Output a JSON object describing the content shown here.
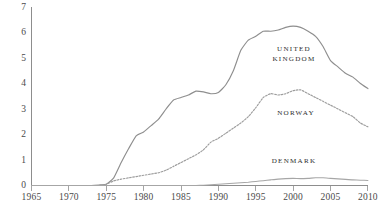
{
  "chart_data": {
    "type": "line",
    "title": "",
    "subtitle": "",
    "xlabel": "",
    "ylabel": "",
    "xlim": [
      1965,
      2010
    ],
    "ylim": [
      0,
      7
    ],
    "grid": false,
    "legend_position": "inline-annotations",
    "x_ticks": [
      "1965",
      "1970",
      "1975",
      "1980",
      "1985",
      "1990",
      "1995",
      "2000",
      "2005",
      "2010"
    ],
    "y_ticks": [
      "0",
      "1",
      "2",
      "3",
      "4",
      "5",
      "6",
      "7"
    ],
    "x": [
      1965,
      1966,
      1967,
      1968,
      1969,
      1970,
      1971,
      1972,
      1973,
      1974,
      1975,
      1976,
      1977,
      1978,
      1979,
      1980,
      1981,
      1982,
      1983,
      1984,
      1985,
      1986,
      1987,
      1988,
      1989,
      1990,
      1991,
      1992,
      1993,
      1994,
      1995,
      1996,
      1997,
      1998,
      1999,
      2000,
      2001,
      2002,
      2003,
      2004,
      2005,
      2006,
      2007,
      2008,
      2009,
      2010
    ],
    "series": [
      {
        "name": "UNITED KINGDOM",
        "label_lines": [
          "UNITED",
          "KINGDOM"
        ],
        "style": "solid",
        "color": "#8e8e8e",
        "values": [
          0.0,
          0.0,
          0.0,
          0.0,
          0.0,
          0.0,
          0.0,
          0.0,
          0.0,
          0.02,
          0.05,
          0.3,
          0.9,
          1.45,
          1.95,
          2.1,
          2.35,
          2.6,
          3.0,
          3.35,
          3.45,
          3.55,
          3.7,
          3.67,
          3.6,
          3.65,
          3.95,
          4.5,
          5.3,
          5.7,
          5.85,
          6.05,
          6.05,
          6.1,
          6.2,
          6.25,
          6.2,
          6.05,
          5.85,
          5.45,
          4.9,
          4.65,
          4.4,
          4.25,
          4.0,
          3.8
        ],
        "peak": {
          "year": 2000,
          "value": 6.25
        },
        "end": {
          "year": 2010,
          "value": 3.8
        }
      },
      {
        "name": "NORWAY",
        "label_lines": [
          "NORWAY"
        ],
        "style": "dotted",
        "color": "#9d9d9d",
        "values": [
          0.0,
          0.0,
          0.0,
          0.0,
          0.0,
          0.0,
          0.0,
          0.0,
          0.0,
          0.0,
          0.05,
          0.18,
          0.25,
          0.3,
          0.35,
          0.4,
          0.45,
          0.5,
          0.6,
          0.75,
          0.9,
          1.05,
          1.2,
          1.4,
          1.7,
          1.85,
          2.05,
          2.25,
          2.45,
          2.7,
          3.05,
          3.45,
          3.6,
          3.55,
          3.6,
          3.72,
          3.75,
          3.6,
          3.45,
          3.3,
          3.15,
          3.0,
          2.85,
          2.7,
          2.45,
          2.3
        ],
        "peak": {
          "year": 2001,
          "value": 3.75
        },
        "end": {
          "year": 2010,
          "value": 2.3
        }
      },
      {
        "name": "DENMARK",
        "label_lines": [
          "DENMARK"
        ],
        "style": "solid",
        "color": "#a6a6a6",
        "values": [
          0.0,
          0.0,
          0.0,
          0.0,
          0.0,
          0.0,
          0.0,
          0.0,
          0.0,
          0.0,
          0.0,
          0.0,
          0.0,
          0.0,
          0.0,
          0.0,
          0.0,
          0.0,
          0.0,
          0.0,
          0.0,
          0.0,
          0.0,
          0.01,
          0.03,
          0.05,
          0.07,
          0.09,
          0.11,
          0.13,
          0.16,
          0.19,
          0.22,
          0.25,
          0.27,
          0.28,
          0.27,
          0.28,
          0.3,
          0.3,
          0.28,
          0.26,
          0.24,
          0.22,
          0.21,
          0.2
        ],
        "peak": {
          "year": 2003,
          "value": 0.3
        },
        "end": {
          "year": 2010,
          "value": 0.2
        }
      }
    ],
    "annotations": [
      {
        "series": "UNITED KINGDOM",
        "lines": [
          "UNITED",
          "KINGDOM"
        ],
        "at_x": 1999,
        "at_y": 5.45
      },
      {
        "series": "NORWAY",
        "lines": [
          "NORWAY"
        ],
        "at_x": 2000,
        "at_y": 3.0
      },
      {
        "series": "DENMARK",
        "lines": [
          "DENMARK"
        ],
        "at_x": 1999,
        "at_y": 1.0
      }
    ]
  }
}
